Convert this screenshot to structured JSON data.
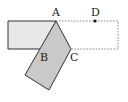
{
  "diagram": {
    "type": "geometry-folded-rectangle",
    "labels": {
      "A": "A",
      "B": "B",
      "C": "C",
      "D": "D"
    },
    "points": {
      "A": [
        56,
        21
      ],
      "B": [
        41,
        49
      ],
      "C": [
        71,
        49
      ],
      "D": [
        95,
        21
      ]
    },
    "colors": {
      "stroke": "#333333",
      "dashed": "#666666",
      "unfolded_fill": "#e6e6e6",
      "folded_fill": "#c8c8c8"
    }
  }
}
